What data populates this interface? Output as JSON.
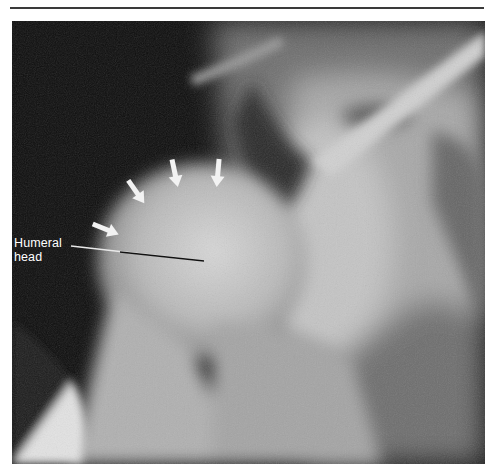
{
  "figure": {
    "type": "radiograph",
    "annotations": {
      "label_line1": "Humeral",
      "label_line2": "head",
      "arrow_count": 5,
      "arrow_color": "#f2f2f2",
      "leader_line_color": "#111111"
    }
  }
}
